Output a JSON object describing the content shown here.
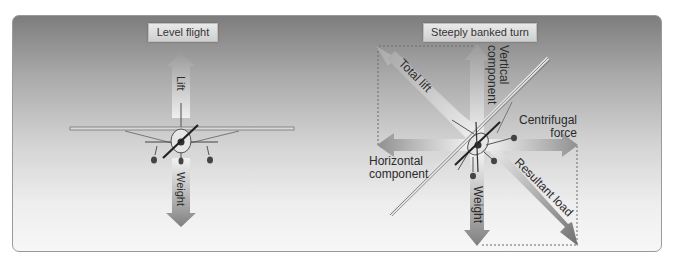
{
  "diagram": {
    "panels": [
      {
        "title": "Level flight",
        "forces": [
          {
            "label": "Lift",
            "direction": "up"
          },
          {
            "label": "Weight",
            "direction": "down"
          }
        ]
      },
      {
        "title": "Steeply banked turn",
        "forces": [
          {
            "label": "Total lift",
            "direction": "up-left"
          },
          {
            "label_line1": "Vertical",
            "label_line2": "component",
            "direction": "up"
          },
          {
            "label_line1": "Centrifugal",
            "label_line2": "force",
            "direction": "right"
          },
          {
            "label_line1": "Horizontal",
            "label_line2": "component",
            "direction": "left"
          },
          {
            "label": "Weight",
            "direction": "down"
          },
          {
            "label": "Resultant load",
            "direction": "down-right"
          }
        ]
      }
    ],
    "colors": {
      "panel_top": "#7d7d7d",
      "panel_bottom": "#f7f7f7",
      "arrow": "#8c8c8c",
      "text": "#2b2b2b"
    }
  }
}
